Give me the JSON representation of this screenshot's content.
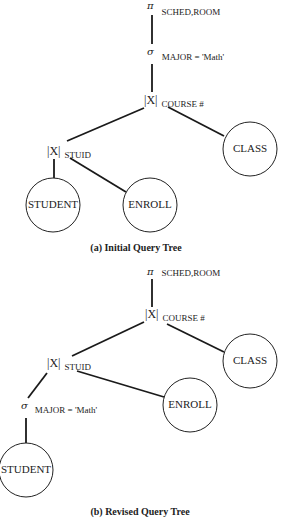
{
  "figure": {
    "tree_a": {
      "caption": "(a) Initial Query Tree",
      "project": {
        "symbol": "π",
        "subscript": "SCHED,ROOM"
      },
      "select": {
        "symbol": "σ",
        "subscript": "MAJOR = 'Math'"
      },
      "join_top": {
        "symbol": "|X|",
        "subscript": "COURSE #"
      },
      "join_bottom": {
        "symbol": "|X|",
        "subscript": "STUID"
      },
      "nodes": {
        "student": "STUDENT",
        "enroll": "ENROLL",
        "class": "CLASS"
      }
    },
    "tree_b": {
      "caption": "(b) Revised Query Tree",
      "project": {
        "symbol": "π",
        "subscript": "SCHED,ROOM"
      },
      "join_top": {
        "symbol": "|X|",
        "subscript": "COURSE #"
      },
      "join_bottom": {
        "symbol": "|X|",
        "subscript": "STUID"
      },
      "select": {
        "symbol": "σ",
        "subscript": "MAJOR = 'Math'"
      },
      "nodes": {
        "student": "STUDENT",
        "enroll": "ENROLL",
        "class": "CLASS"
      }
    }
  },
  "colors": {
    "line": "#1a1a1a",
    "text": "#222222",
    "background": "#ffffff"
  }
}
